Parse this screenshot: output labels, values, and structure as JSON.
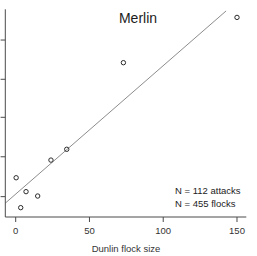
{
  "chart_data": {
    "type": "scatter",
    "title": "Merlin",
    "xlabel": "Dunlin flock size",
    "ylabel": "",
    "x_ticks": [
      0,
      50,
      100,
      150
    ],
    "x_range": [
      -7,
      156
    ],
    "y_axis": {
      "labels_visible": false,
      "note": "y-axis tick labels cropped out of screenshot; positions given as fraction of axis height",
      "tick_fractions": [
        0.098,
        0.29,
        0.48,
        0.663,
        0.852
      ]
    },
    "points": [
      {
        "x": 0.3,
        "y_frac": 0.189
      },
      {
        "x": 3.4,
        "y_frac": 0.045
      },
      {
        "x": 7.0,
        "y_frac": 0.122
      },
      {
        "x": 14.9,
        "y_frac": 0.101
      },
      {
        "x": 23.9,
        "y_frac": 0.274
      },
      {
        "x": 34.6,
        "y_frac": 0.326
      },
      {
        "x": 73.0,
        "y_frac": 0.743
      },
      {
        "x": 150.0,
        "y_frac": 0.961
      }
    ],
    "trend_line": {
      "x1": -7.0,
      "y_frac1": 0.067,
      "x2": 142.6,
      "y_frac2": 0.992
    },
    "annotations": [
      "N = 112 attacks",
      "N = 455 flocks"
    ],
    "grid": false,
    "legend": "none"
  },
  "colors": {
    "background": "#ffffff",
    "axis": "#4a4a4a",
    "text": "#1c1c1c",
    "point": "#2b2b2b",
    "trend": "#7f7f7f"
  }
}
